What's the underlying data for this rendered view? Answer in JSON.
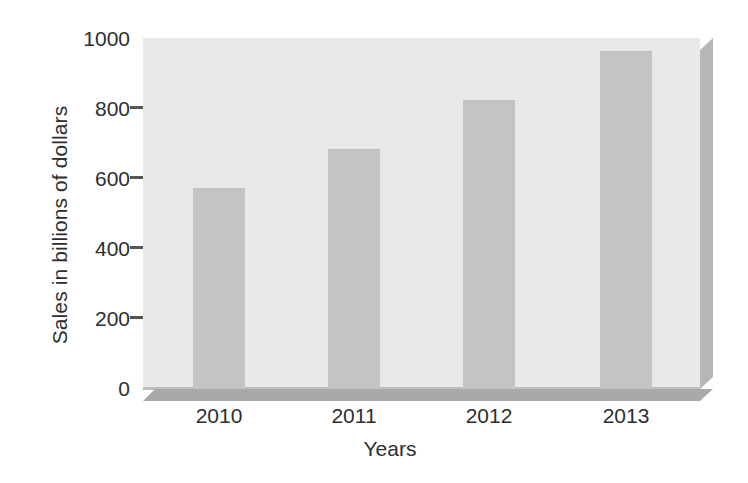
{
  "chart_data": {
    "type": "bar",
    "title": "",
    "xlabel": "Years",
    "ylabel": "Sales in billions of dollars",
    "categories": [
      "2010",
      "2011",
      "2012",
      "2013"
    ],
    "values": [
      570,
      680,
      820,
      960
    ],
    "ylim": [
      0,
      1000
    ],
    "ytick_labels": [
      "0",
      "200",
      "400",
      "600",
      "800",
      "1000"
    ],
    "ytick_values": [
      0,
      200,
      400,
      600,
      800,
      1000
    ],
    "grid": false,
    "legend": null,
    "series": [
      {
        "name": "Sales",
        "values": [
          570,
          680,
          820,
          960
        ]
      }
    ],
    "style": {
      "bar_color": "#c4c4c4",
      "plot_background": "#e9e9e9",
      "floor_color": "#a9a9a9",
      "side_color": "#b6b6b6",
      "text_color": "#2e2e2e",
      "page_background": "#ffffff"
    }
  }
}
